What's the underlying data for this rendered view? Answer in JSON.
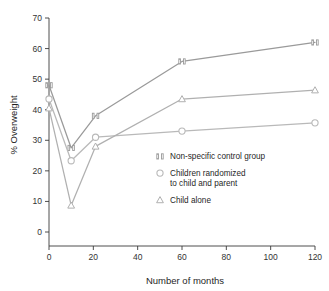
{
  "chart_data": {
    "type": "line",
    "title": "",
    "xlabel": "Number of months",
    "ylabel": "% Overweight",
    "xlim": [
      0,
      120
    ],
    "ylim": [
      0,
      70
    ],
    "xticks": [
      0,
      20,
      40,
      60,
      80,
      100,
      120
    ],
    "yticks": [
      0,
      10,
      20,
      30,
      40,
      50,
      60,
      70
    ],
    "xtick_labels": [
      "0",
      "20",
      "40",
      "60",
      "80",
      "100",
      "120"
    ],
    "ytick_labels": [
      "0",
      "10",
      "20",
      "30",
      "40",
      "50",
      "60",
      "70"
    ],
    "grid": false,
    "legend_position": "center-right",
    "x": [
      0,
      10,
      21,
      60,
      120
    ],
    "series": [
      {
        "name": "Non-specific control group",
        "marker": "double-bar",
        "color": "#9a9a9a",
        "values": [
          48.0,
          27.5,
          38.0,
          55.8,
          62.0
        ]
      },
      {
        "name": "Children randomized to child and parent",
        "marker": "circle",
        "color": "#b9b9b9",
        "values": [
          43.5,
          23.3,
          31.0,
          33.0,
          35.7
        ]
      },
      {
        "name": "Child alone",
        "marker": "triangle",
        "color": "#b0b0b0",
        "values": [
          40.5,
          8.7,
          28.0,
          43.5,
          46.4
        ]
      }
    ]
  },
  "axes": {
    "y_title": "% Overweight",
    "x_title": "Number of months"
  },
  "legend": {
    "entries": [
      {
        "marker": "double-bar",
        "lines": [
          "Non-specific control group"
        ]
      },
      {
        "marker": "circle",
        "lines": [
          "Children randomized",
          "to child and parent"
        ]
      },
      {
        "marker": "triangle",
        "lines": [
          "Child alone"
        ]
      }
    ]
  },
  "colors": {
    "series_1": "#9a9a9a",
    "series_2": "#b9b9b9",
    "series_3": "#b0b0b0",
    "axis": "#3a3a3a",
    "text": "#1f1f1f",
    "background": "#ffffff"
  }
}
